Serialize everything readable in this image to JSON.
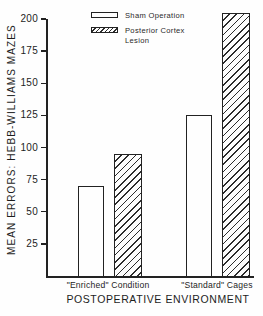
{
  "figure": {
    "paper_color": "#fefefe",
    "ink_color": "#222222"
  },
  "chart_data": {
    "type": "bar",
    "title": "",
    "categories": [
      "\"Enriched\" Condition",
      "\"Standard\" Cages"
    ],
    "series": [
      {
        "name": "Sham Operation",
        "style": "plain",
        "values": [
          70,
          125
        ]
      },
      {
        "name": "Posterior Cortex Lesion",
        "style": "hatched",
        "values": [
          95,
          205
        ]
      }
    ],
    "xlabel": "POSTOPERATIVE ENVIRONMENT",
    "ylabel": "MEAN ERRORS: HEBB-WILLIAMS MAZES",
    "ylim": [
      0,
      200
    ],
    "yticks": [
      25,
      50,
      75,
      100,
      125,
      150,
      175,
      200
    ],
    "grid": false,
    "legend_position": "top-inside",
    "bar_fill_styles": {
      "plain": "white outlined bar",
      "hatched": "diagonal / hatching"
    },
    "note": "Standard Cages / Posterior Cortex Lesion bar extends above the 200 axis maximum (~205)"
  },
  "legend": {
    "items": [
      {
        "label": "Sham Operation",
        "swatch": "plain"
      },
      {
        "label": "Posterior Cortex Lesion",
        "swatch": "hatched"
      }
    ]
  }
}
